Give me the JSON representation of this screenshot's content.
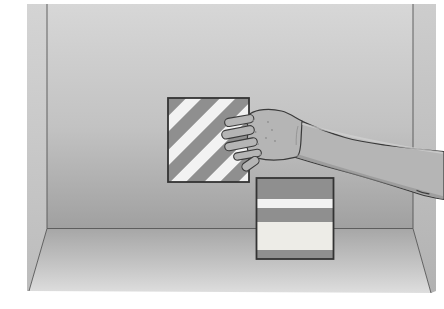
{
  "scene": {
    "description": "Grayscale textbook illustration: a hand and forearm reach in from the right side into a box-shaped room to grasp a diagonally striped square card mounted on the back wall; a second square card with horizontal stripes stands upright on the floor in the right foreground.",
    "elements": [
      "room-box",
      "wall-card-diagonal-stripes",
      "floor-card-horizontal-stripes",
      "reaching-arm-and-hand"
    ]
  },
  "colors": {
    "page_bg": "#ffffff",
    "wall_top": "#d7d7d7",
    "wall_mid": "#c2c2c2",
    "wall_bottom": "#a0a0a0",
    "floor_back": "#a6a6a6",
    "floor_mid": "#c6c6c6",
    "floor_front": "#dedede",
    "left_wall_top": "#d4d4d4",
    "left_wall_bottom": "#bcbcbc",
    "right_wall_top": "#cdcdcd",
    "right_wall_bottom": "#b2b2b2",
    "edge_line": "#555555",
    "card_border": "#333333",
    "stripe_gray": "#8f8f8f",
    "stripe_white": "#f2f2f2",
    "stripe_cream": "#edece7",
    "skin": "#b5b5b5",
    "skin_shadow": "#8f8f8f",
    "skin_highlight": "#d2d2d2",
    "outline": "#3a3a3a"
  },
  "cards": {
    "wall_card": {
      "pattern": "diagonal-stripes",
      "stripe_direction": "bottom-left-to-top-right",
      "stripe_period": 24,
      "gray_width": 13
    },
    "floor_card": {
      "pattern": "horizontal-stripes",
      "rows": [
        {
          "y": 178,
          "height": 21,
          "fill": "#8f8f8f"
        },
        {
          "y": 199,
          "height": 9,
          "fill": "#f2f2f2"
        },
        {
          "y": 208,
          "height": 14,
          "fill": "#8f8f8f"
        },
        {
          "y": 222,
          "height": 28,
          "fill": "#edece7"
        },
        {
          "y": 250,
          "height": 9,
          "fill": "#8f8f8f"
        }
      ]
    }
  }
}
